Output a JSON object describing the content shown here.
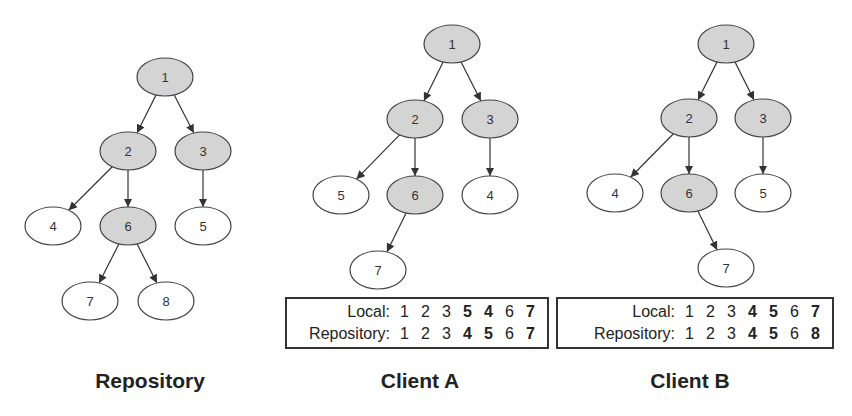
{
  "colors": {
    "shaded_node": "#d4d4d4",
    "plain_node": "#ffffff",
    "stroke": "#444444"
  },
  "graphs": {
    "repository": {
      "caption": "Repository",
      "nodes": [
        {
          "id": "1",
          "x": 165,
          "y": 77,
          "shaded": true
        },
        {
          "id": "2",
          "x": 128,
          "y": 151,
          "shaded": true
        },
        {
          "id": "3",
          "x": 203,
          "y": 151,
          "shaded": true
        },
        {
          "id": "4",
          "x": 53,
          "y": 226,
          "shaded": false
        },
        {
          "id": "6",
          "x": 128,
          "y": 226,
          "shaded": true
        },
        {
          "id": "5",
          "x": 203,
          "y": 226,
          "shaded": false
        },
        {
          "id": "7",
          "x": 90,
          "y": 301,
          "shaded": false
        },
        {
          "id": "8",
          "x": 166,
          "y": 301,
          "shaded": false
        }
      ],
      "edges": [
        [
          "1",
          "2"
        ],
        [
          "1",
          "3"
        ],
        [
          "2",
          "4"
        ],
        [
          "2",
          "6"
        ],
        [
          "3",
          "5"
        ],
        [
          "6",
          "7"
        ],
        [
          "6",
          "8"
        ]
      ]
    },
    "client_a": {
      "caption": "Client A",
      "nodes": [
        {
          "id": "1",
          "x": 452,
          "y": 44,
          "shaded": true
        },
        {
          "id": "2",
          "x": 415,
          "y": 119,
          "shaded": true
        },
        {
          "id": "3",
          "x": 490,
          "y": 119,
          "shaded": true
        },
        {
          "id": "5",
          "x": 341,
          "y": 195,
          "shaded": false
        },
        {
          "id": "6",
          "x": 415,
          "y": 195,
          "shaded": true
        },
        {
          "id": "4",
          "x": 490,
          "y": 195,
          "shaded": false
        },
        {
          "id": "7",
          "x": 378,
          "y": 270,
          "shaded": false
        }
      ],
      "edges": [
        [
          "1",
          "2"
        ],
        [
          "1",
          "3"
        ],
        [
          "2",
          "5"
        ],
        [
          "2",
          "6"
        ],
        [
          "3",
          "4"
        ],
        [
          "6",
          "7"
        ]
      ],
      "table": {
        "rows": [
          {
            "label": "Local:",
            "values": [
              {
                "v": "1",
                "b": false
              },
              {
                "v": "2",
                "b": false
              },
              {
                "v": "3",
                "b": false
              },
              {
                "v": "5",
                "b": true
              },
              {
                "v": "4",
                "b": true
              },
              {
                "v": "6",
                "b": false
              },
              {
                "v": "7",
                "b": true
              }
            ]
          },
          {
            "label": "Repository:",
            "values": [
              {
                "v": "1",
                "b": false
              },
              {
                "v": "2",
                "b": false
              },
              {
                "v": "3",
                "b": false
              },
              {
                "v": "4",
                "b": true
              },
              {
                "v": "5",
                "b": true
              },
              {
                "v": "6",
                "b": false
              },
              {
                "v": "7",
                "b": true
              }
            ]
          }
        ]
      }
    },
    "client_b": {
      "caption": "Client B",
      "nodes": [
        {
          "id": "1",
          "x": 726,
          "y": 44,
          "shaded": true
        },
        {
          "id": "2",
          "x": 689,
          "y": 118,
          "shaded": true
        },
        {
          "id": "3",
          "x": 763,
          "y": 118,
          "shaded": true
        },
        {
          "id": "4",
          "x": 615,
          "y": 193,
          "shaded": false
        },
        {
          "id": "6",
          "x": 689,
          "y": 193,
          "shaded": true
        },
        {
          "id": "5",
          "x": 763,
          "y": 193,
          "shaded": false
        },
        {
          "id": "7",
          "x": 726,
          "y": 268,
          "shaded": false
        }
      ],
      "edges": [
        [
          "1",
          "2"
        ],
        [
          "1",
          "3"
        ],
        [
          "2",
          "4"
        ],
        [
          "2",
          "6"
        ],
        [
          "3",
          "5"
        ],
        [
          "6",
          "7"
        ]
      ],
      "table": {
        "rows": [
          {
            "label": "Local:",
            "values": [
              {
                "v": "1",
                "b": false
              },
              {
                "v": "2",
                "b": false
              },
              {
                "v": "3",
                "b": false
              },
              {
                "v": "4",
                "b": true
              },
              {
                "v": "5",
                "b": true
              },
              {
                "v": "6",
                "b": false
              },
              {
                "v": "7",
                "b": true
              }
            ]
          },
          {
            "label": "Repository:",
            "values": [
              {
                "v": "1",
                "b": false
              },
              {
                "v": "2",
                "b": false
              },
              {
                "v": "3",
                "b": false
              },
              {
                "v": "4",
                "b": true
              },
              {
                "v": "5",
                "b": true
              },
              {
                "v": "6",
                "b": false
              },
              {
                "v": "8",
                "b": true
              }
            ]
          }
        ]
      }
    }
  }
}
